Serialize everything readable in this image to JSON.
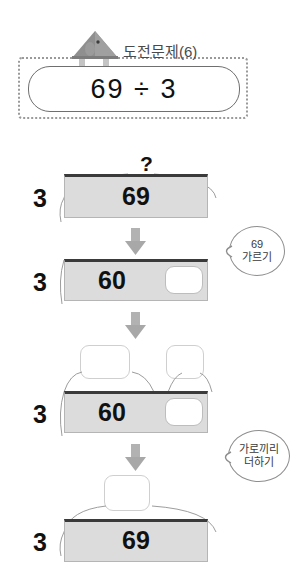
{
  "header": {
    "title": "도전문제(6)",
    "icon": "house-bird-icon",
    "equation": "69 ÷ 3"
  },
  "colors": {
    "bar_fill": "#dcdcdc",
    "bar_top_border": "#3a3a3a",
    "arrow": "#a8a8a8",
    "bubble_border": "#8d8d8d",
    "icon_gray": "#8f8f8f",
    "text": "#111111"
  },
  "steps": [
    {
      "name": "step-1",
      "divisor": "3",
      "top_label": "?",
      "cells": [
        {
          "value": "69",
          "empty": false
        }
      ]
    },
    {
      "name": "step-2",
      "divisor": "3",
      "top_label": "",
      "cells": [
        {
          "value": "60",
          "empty": false
        },
        {
          "value": "",
          "empty": true
        }
      ]
    },
    {
      "name": "step-3",
      "divisor": "3",
      "top_label": "",
      "top_boxes": [
        "",
        ""
      ],
      "cells": [
        {
          "value": "60",
          "empty": false
        },
        {
          "value": "",
          "empty": true
        }
      ]
    },
    {
      "name": "step-4",
      "divisor": "3",
      "top_label": "",
      "top_boxes": [
        ""
      ],
      "cells": [
        {
          "value": "69",
          "empty": false
        }
      ]
    }
  ],
  "bubbles": [
    {
      "name": "bubble-split",
      "line1": "69",
      "line2": "가르기"
    },
    {
      "name": "bubble-add",
      "line1": "가로끼리",
      "line2": "더하기"
    }
  ]
}
